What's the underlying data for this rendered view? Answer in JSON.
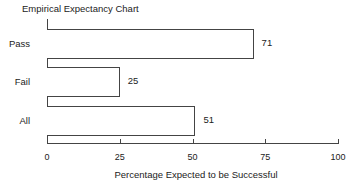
{
  "chart_data": {
    "type": "bar",
    "orientation": "horizontal",
    "title": "Empirical Expectancy Chart",
    "xlabel": "Percentage Expected to be Successful",
    "ylabel": "",
    "categories": [
      "Pass",
      "Fail",
      "All"
    ],
    "values": [
      71,
      25,
      51
    ],
    "data_labels": [
      "71",
      "25",
      "51"
    ],
    "xlim": [
      0,
      100
    ],
    "xticks": [
      0,
      25,
      50,
      75,
      100
    ],
    "xtick_labels": [
      "0",
      "25",
      "50",
      "75",
      "100"
    ],
    "grid": false,
    "legend": null
  },
  "colors": {
    "bar_fill": "#ffffff",
    "bar_stroke": "#444444",
    "text": "#222222"
  }
}
